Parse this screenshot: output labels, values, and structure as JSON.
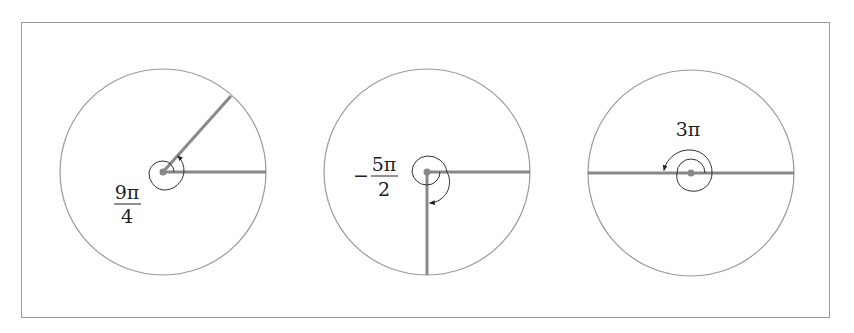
{
  "colors": {
    "frame": "#9a9a9a",
    "circle": "#9a9a9a",
    "ray": "#888888",
    "spiral": "#333333",
    "center_dot": "#888888",
    "label": "#222222"
  },
  "diagrams": [
    {
      "name": "angle-9pi-over-4",
      "label": {
        "sign": "",
        "numerator": "9π",
        "denominator": "4",
        "inline": ""
      },
      "center": [
        163,
        172
      ],
      "radius": 103,
      "initial_ray_angle_deg": 0,
      "terminal_ray_angle_deg": 45,
      "rotation": "counterclockwise",
      "turns_description": "one full turn plus π/4"
    },
    {
      "name": "angle-neg-5pi-over-2",
      "label": {
        "sign": "−",
        "numerator": "5π",
        "denominator": "2",
        "inline": ""
      },
      "center": [
        427,
        172
      ],
      "radius": 103,
      "initial_ray_angle_deg": 0,
      "terminal_ray_angle_deg": -90,
      "rotation": "clockwise",
      "turns_description": "one full turn plus π/2 clockwise"
    },
    {
      "name": "angle-3pi",
      "label": {
        "sign": "",
        "numerator": "",
        "denominator": "",
        "inline": "3π"
      },
      "center": [
        691,
        173
      ],
      "radius": 103,
      "initial_ray_angle_deg": 0,
      "terminal_ray_angle_deg": 180,
      "rotation": "counterclockwise",
      "turns_description": "one full turn plus π"
    }
  ]
}
